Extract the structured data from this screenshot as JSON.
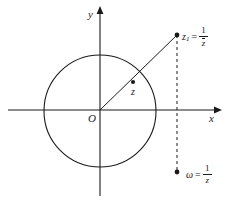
{
  "figure": {
    "background_color": "#ffffff",
    "stroke_color": "#1a1a1a",
    "axes": {
      "x_label": "x",
      "y_label": "y",
      "origin_label": "O",
      "x_axis": {
        "x1": 8,
        "y1": 110,
        "x2": 220,
        "y2": 110
      },
      "y_axis": {
        "x1": 100,
        "y1": 8,
        "x2": 100,
        "y2": 196
      }
    },
    "unit_circle": {
      "cx": 100,
      "cy": 111,
      "r": 56
    },
    "points": [
      {
        "name": "z",
        "label": "z",
        "label_text": "z",
        "cx": 133,
        "cy": 82,
        "r": 2.1,
        "inside_circle": true
      },
      {
        "name": "z1",
        "label_lhs": "z",
        "label_sub": "1",
        "label_eq": "=",
        "numerator": "1",
        "denominator": "z",
        "denominator_conjugate": true,
        "cx": 177,
        "cy": 35,
        "r": 2.4,
        "inside_circle": false
      },
      {
        "name": "omega",
        "label_lhs": "ω",
        "label_sub": "",
        "label_eq": "=",
        "numerator": "1",
        "denominator": "z",
        "denominator_conjugate": false,
        "cx": 177,
        "cy": 172,
        "r": 2.4,
        "inside_circle": false
      }
    ],
    "ray": {
      "x1": 100,
      "y1": 110,
      "x2": 177,
      "y2": 35
    },
    "dashed_segment": {
      "x": 177,
      "y1": 35,
      "y2": 172,
      "dash": "3,3"
    }
  }
}
